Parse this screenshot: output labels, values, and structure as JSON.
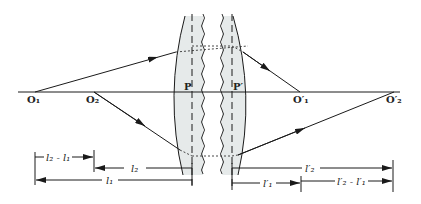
{
  "figure": {
    "colors": {
      "line": "#1a1a1a",
      "lens_fill": "#e6eaea",
      "dashed": "#333333"
    }
  },
  "points": {
    "object_1": "O₁",
    "object_2": "O₂",
    "image_1": "O′₁",
    "image_2": "O′₂"
  },
  "principal_planes": {
    "front": "P",
    "back": "P′"
  },
  "dimensions": {
    "l2_minus_l1": "l₂ - l₁",
    "l2": "l₂",
    "l1": "l₁",
    "l2_prime": "l′₂",
    "l1_prime": "l′₁",
    "l2p_minus_l1p": "l′₂ - l′₁"
  }
}
